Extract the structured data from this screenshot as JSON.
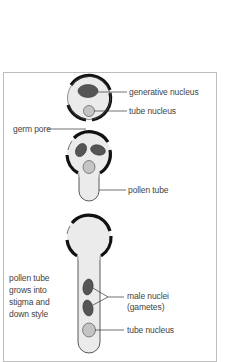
{
  "diagram": {
    "colors": {
      "wall": "#111111",
      "cytoplasm": "#ebebeb",
      "generative_nucleus": "#555555",
      "tube_nucleus": "#c4c4c4",
      "frame": "#bdbdbd",
      "leader": "#333333"
    },
    "stages": [
      {
        "name": "pollen-grain",
        "labels": [
          "generative nucleus",
          "tube nucleus",
          "germ pore"
        ]
      },
      {
        "name": "germinating-grain",
        "labels": [
          "pollen tube"
        ]
      },
      {
        "name": "elongated-tube",
        "labels": [
          "male nuclei (gametes)",
          "tube nucleus"
        ]
      }
    ],
    "labels": {
      "generative_nucleus": "generative nucleus",
      "tube_nucleus_1": "tube nucleus",
      "germ_pore": "germ pore",
      "pollen_tube": "pollen tube",
      "tube_growth_line1": "pollen tube",
      "tube_growth_line2": "grows into",
      "tube_growth_line3": "stigma and",
      "tube_growth_line4": "down style",
      "male_nuclei_line1": "male nuclei",
      "male_nuclei_line2": "(gametes)",
      "tube_nucleus_2": "tube nucleus"
    }
  }
}
